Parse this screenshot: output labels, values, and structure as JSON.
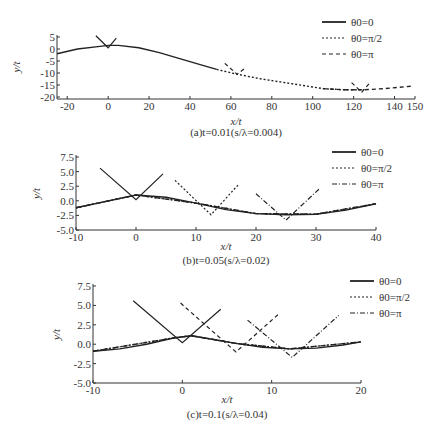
{
  "chart_data": [
    {
      "type": "line",
      "panel": "a",
      "caption": "(a)t=0.01(s/λ=0.004)",
      "xlabel": "x/t",
      "ylabel": "y/t",
      "xlim": [
        -25,
        150
      ],
      "ylim": [
        -20,
        5
      ],
      "xticks": [
        -20,
        0,
        20,
        40,
        60,
        80,
        100,
        120,
        140,
        150
      ],
      "yticks": [
        5,
        0,
        -5,
        -10,
        -15,
        -20
      ],
      "legend": [
        "θ0=0",
        "θ0=π/2",
        "θ0=π"
      ],
      "series": [
        {
          "name": "θ0=0",
          "style": "solid",
          "x": [
            -25,
            -15,
            -5,
            0,
            5,
            15,
            25,
            35,
            45,
            53
          ],
          "y": [
            -2,
            0,
            1,
            1.5,
            1.5,
            0.5,
            -1.5,
            -4,
            -6.5,
            -8.5
          ]
        },
        {
          "name": "θ0=π/2",
          "style": "dotted",
          "x": [
            53,
            63,
            75,
            90,
            105,
            115,
            125
          ],
          "y": [
            -8.5,
            -10.5,
            -12.5,
            -14.5,
            -16.5,
            -17,
            -17
          ]
        },
        {
          "name": "θ0=π",
          "style": "dashed",
          "x": [
            105,
            115,
            125,
            135,
            148
          ],
          "y": [
            -16.5,
            -17,
            -17,
            -16.5,
            -15.5
          ]
        }
      ],
      "wedges": [
        {
          "apex": [
            0,
            0.5
          ],
          "left": [
            -6,
            5.5
          ],
          "right": [
            4,
            4.5
          ]
        },
        {
          "apex": [
            63,
            -10.5
          ],
          "left": [
            57,
            -6
          ],
          "right": [
            67,
            -8
          ],
          "style": "dashed"
        },
        {
          "apex": [
            124,
            -18
          ],
          "left": [
            119,
            -14
          ],
          "right": [
            128,
            -14
          ],
          "style": "dashed"
        }
      ]
    },
    {
      "type": "line",
      "panel": "b",
      "caption": "(b)t=0.05(s/λ=0.02)",
      "xlabel": "x/t",
      "ylabel": "y/t",
      "xlim": [
        -10,
        40
      ],
      "ylim": [
        -5,
        7.5
      ],
      "xticks": [
        -10,
        0,
        10,
        20,
        30,
        40
      ],
      "yticks": [
        "7.5",
        "5.0",
        "2.5",
        "0.0",
        "-2.5",
        "-5.0"
      ],
      "legend": [
        "θ0=0",
        "θ0=π/2",
        "θ0=π"
      ],
      "series": [
        {
          "name": "θ0=0",
          "style": "solid",
          "x": [
            -10,
            -5,
            0,
            5,
            10,
            15,
            20,
            25,
            30,
            35,
            40
          ],
          "y": [
            -1.2,
            -0.1,
            1.0,
            0.6,
            -0.4,
            -1.5,
            -2.2,
            -2.4,
            -2.3,
            -1.6,
            -0.5
          ]
        },
        {
          "name": "θ0=π/2",
          "style": "dotted",
          "x": [
            -10,
            0,
            10,
            20,
            30,
            40
          ],
          "y": [
            -1.2,
            1.0,
            -0.4,
            -2.2,
            -2.3,
            -0.5
          ]
        },
        {
          "name": "θ0=π",
          "style": "dashdot",
          "x": [
            -10,
            0,
            10,
            20,
            30,
            40
          ],
          "y": [
            -1.2,
            1.0,
            -0.4,
            -2.2,
            -2.3,
            -0.5
          ]
        }
      ],
      "wedges": [
        {
          "apex": [
            0,
            0.2
          ],
          "left": [
            -6,
            5.6
          ],
          "right": [
            4.5,
            4.6
          ],
          "style": "solid"
        },
        {
          "apex": [
            12.5,
            -2.4
          ],
          "left": [
            6.5,
            3.5
          ],
          "right": [
            17,
            2.7
          ],
          "style": "dotted"
        },
        {
          "apex": [
            25,
            -3.3
          ],
          "left": [
            20,
            1.2
          ],
          "right": [
            30.5,
            2.0
          ],
          "style": "dashdot"
        }
      ]
    },
    {
      "type": "line",
      "panel": "c",
      "caption": "(c)t=0.1(s/λ=0.04)",
      "xlabel": "x/t",
      "ylabel": "y/t",
      "xlim": [
        -10,
        20
      ],
      "ylim": [
        -5,
        7.5
      ],
      "xticks": [
        -10,
        0,
        10,
        20
      ],
      "yticks": [
        "7.5",
        "5.0",
        "2.5",
        "0.0",
        "-2.5",
        "-5.0"
      ],
      "legend": [
        "θ0=0",
        "θ0=π/2",
        "θ0=π"
      ],
      "series": [
        {
          "name": "θ0=0",
          "style": "solid",
          "x": [
            -10,
            -7,
            -4,
            -1,
            1,
            3,
            6,
            9,
            12,
            15,
            18,
            20
          ],
          "y": [
            -0.9,
            -0.6,
            0,
            0.8,
            1.1,
            0.7,
            0.1,
            -0.4,
            -0.6,
            -0.5,
            -0.1,
            0.3
          ]
        },
        {
          "name": "θ0=π/2",
          "style": "dotted",
          "x": [
            -10,
            -1,
            1,
            6,
            12,
            20
          ],
          "y": [
            -0.9,
            0.8,
            1.1,
            0.1,
            -0.6,
            0.3
          ]
        },
        {
          "name": "θ0=π",
          "style": "dashdot",
          "x": [
            -10,
            -1,
            1,
            6,
            12,
            20
          ],
          "y": [
            -0.9,
            0.8,
            1.1,
            0.1,
            -0.6,
            0.3
          ]
        }
      ],
      "wedges": [
        {
          "apex": [
            0,
            0.2
          ],
          "left": [
            -5.5,
            5.6
          ],
          "right": [
            4.3,
            4.5
          ],
          "style": "solid"
        },
        {
          "apex": [
            6,
            -1.0
          ],
          "left": [
            -0.2,
            5.3
          ],
          "right": [
            10.7,
            3.8
          ],
          "style": "dashed"
        },
        {
          "apex": [
            12.3,
            -1.7
          ],
          "left": [
            7.3,
            3.1
          ],
          "right": [
            17.5,
            3.7
          ],
          "style": "dashdot"
        }
      ]
    }
  ]
}
